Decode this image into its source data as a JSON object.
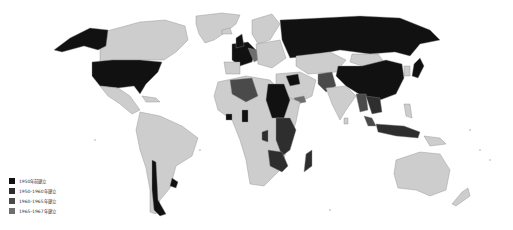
{
  "map": {
    "type": "choropleth world map",
    "colors": {
      "before_1950": "#111111",
      "1950_1960": "#2e2e2e",
      "1960_1965": "#4a4a4a",
      "1965_1967": "#6e6e6e",
      "no_data": "#cdcdcd",
      "border": "#8a8a8a",
      "background": "#ffffff"
    }
  },
  "legend": {
    "items": [
      {
        "label": "1950年前建立",
        "color": "#111111"
      },
      {
        "label": "1950-1960年建立",
        "color": "#2e2e2e"
      },
      {
        "label": "1960-1965年建立",
        "color": "#4a4a4a"
      },
      {
        "label": "1965-1967年建立",
        "color": "#6e6e6e"
      }
    ]
  }
}
